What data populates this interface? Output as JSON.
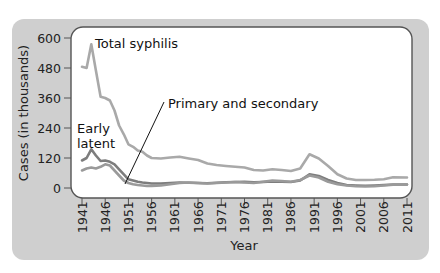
{
  "chart_data": {
    "type": "line",
    "title": "",
    "xlabel": "Year",
    "ylabel": "Cases (in thousands)",
    "ylim": [
      0,
      600
    ],
    "xlim": [
      1941,
      2011
    ],
    "grid": false,
    "legend": "inline annotations",
    "y_ticks": [
      "0",
      "120",
      "240",
      "360",
      "480",
      "600"
    ],
    "x_ticks": [
      "1941",
      "1946",
      "1951",
      "1956",
      "1961",
      "1966",
      "1971",
      "1976",
      "1981",
      "1986",
      "1991",
      "1996",
      "2001",
      "2006",
      "2011"
    ],
    "x": [
      1941,
      1942,
      1943,
      1944,
      1945,
      1946,
      1947,
      1948,
      1949,
      1950,
      1951,
      1952,
      1953,
      1954,
      1955,
      1956,
      1958,
      1960,
      1962,
      1964,
      1966,
      1968,
      1970,
      1972,
      1974,
      1976,
      1978,
      1980,
      1982,
      1984,
      1986,
      1988,
      1990,
      1992,
      1994,
      1996,
      1998,
      2000,
      2002,
      2004,
      2006,
      2008,
      2011
    ],
    "series": [
      {
        "name": "Total syphilis",
        "color": "#a9a9a9",
        "values": [
          485,
          480,
          575,
          470,
          365,
          360,
          350,
          310,
          250,
          215,
          175,
          165,
          150,
          145,
          130,
          120,
          118,
          122,
          125,
          118,
          112,
          98,
          92,
          88,
          85,
          82,
          72,
          70,
          75,
          72,
          68,
          78,
          135,
          118,
          88,
          55,
          38,
          32,
          32,
          33,
          35,
          43,
          42
        ]
      },
      {
        "name": "Early latent",
        "color": "#7d7d7d",
        "values": [
          110,
          120,
          155,
          130,
          108,
          110,
          105,
          95,
          75,
          55,
          35,
          30,
          25,
          22,
          20,
          18,
          18,
          20,
          22,
          21,
          20,
          19,
          21,
          23,
          24,
          25,
          23,
          24,
          26,
          25,
          24,
          30,
          55,
          48,
          32,
          20,
          12,
          10,
          9,
          10,
          12,
          14,
          14
        ]
      },
      {
        "name": "Primary and secondary",
        "color": "#9a9a9a",
        "values": [
          70,
          78,
          82,
          78,
          85,
          95,
          90,
          70,
          50,
          30,
          20,
          15,
          12,
          10,
          8,
          8,
          10,
          15,
          20,
          22,
          20,
          18,
          20,
          22,
          24,
          22,
          20,
          25,
          30,
          28,
          25,
          32,
          50,
          42,
          25,
          15,
          10,
          7,
          6,
          7,
          10,
          13,
          14
        ]
      }
    ],
    "annotations": [
      {
        "text": "Total syphilis",
        "target_series": "Total syphilis"
      },
      {
        "text": "Early",
        "text2": "latent",
        "target_series": "Early latent"
      },
      {
        "text": "Primary and secondary",
        "target_series": "Primary and secondary",
        "pointer": true
      }
    ]
  },
  "colors": {
    "frame": "#cfcfcf",
    "panel": "#ffffff",
    "panel_border": "#555555",
    "axis": "#555555"
  }
}
